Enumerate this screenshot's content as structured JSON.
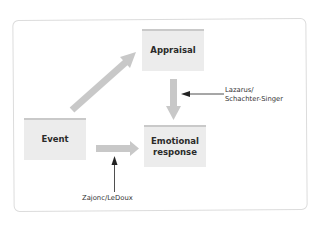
{
  "diagram": {
    "nodes": {
      "appraisal": {
        "label": "Appraisal"
      },
      "event": {
        "label": "Event"
      },
      "emotional_response": {
        "line1": "Emotional",
        "line2": "response"
      }
    },
    "annotations": {
      "lazarus": {
        "line1": "Lazarus/",
        "line2": "Schachter-Singer"
      },
      "zajonc": {
        "label": "Zajonc/LeDoux"
      }
    },
    "edges": [
      {
        "from": "event",
        "to": "appraisal"
      },
      {
        "from": "appraisal",
        "to": "emotional_response"
      },
      {
        "from": "event",
        "to": "emotional_response"
      }
    ],
    "colors": {
      "box_fill": "#ececec",
      "box_top_border": "#c9c9c9",
      "flow_arrow": "#c8c8c8",
      "pointer_arrow": "#222222",
      "frame_border": "#dcdcdc"
    }
  }
}
